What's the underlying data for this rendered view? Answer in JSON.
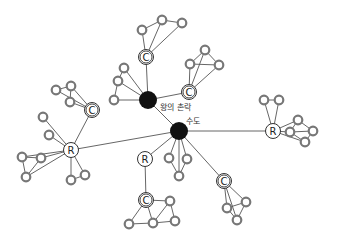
{
  "diagram": {
    "title": "",
    "colors": {
      "edge": "#555555",
      "small_node_stroke": "#777777",
      "hub_fill": "#111111",
      "ring_stroke": "#333333",
      "background": "#ffffff"
    },
    "hubs": [
      {
        "id": "royal-village",
        "label": "왕의 촌락",
        "x": 148,
        "y": 100,
        "r": 9,
        "label_x": 160,
        "label_y": 110
      },
      {
        "id": "capital",
        "label": "수도",
        "x": 179,
        "y": 131,
        "r": 9,
        "label_x": 186,
        "label_y": 124
      }
    ],
    "lettered_nodes": [
      {
        "id": "c-top",
        "letter": "C",
        "x": 146,
        "y": 57
      },
      {
        "id": "c-royal-right",
        "letter": "C",
        "x": 189,
        "y": 92
      },
      {
        "id": "c-left",
        "letter": "C",
        "x": 92,
        "y": 110
      },
      {
        "id": "r-left",
        "letter": "R",
        "x": 71,
        "y": 150
      },
      {
        "id": "r-right",
        "letter": "R",
        "x": 273,
        "y": 131
      },
      {
        "id": "r-bottom",
        "letter": "R",
        "x": 145,
        "y": 159
      },
      {
        "id": "c-bottom",
        "letter": "C",
        "x": 146,
        "y": 200
      },
      {
        "id": "c-bottom-right",
        "letter": "C",
        "x": 224,
        "y": 181
      }
    ],
    "small_nodes": [
      {
        "id": "t1",
        "x": 142,
        "y": 30
      },
      {
        "id": "t2",
        "x": 162,
        "y": 20
      },
      {
        "id": "t3",
        "x": 182,
        "y": 23
      },
      {
        "id": "u1",
        "x": 205,
        "y": 50
      },
      {
        "id": "u2",
        "x": 190,
        "y": 64
      },
      {
        "id": "u3",
        "x": 219,
        "y": 65
      },
      {
        "id": "k1",
        "x": 124,
        "y": 68
      },
      {
        "id": "k2",
        "x": 118,
        "y": 81
      },
      {
        "id": "k3",
        "x": 114,
        "y": 100
      },
      {
        "id": "l1",
        "x": 56,
        "y": 90
      },
      {
        "id": "l2",
        "x": 71,
        "y": 86
      },
      {
        "id": "l3",
        "x": 70,
        "y": 102
      },
      {
        "id": "m1",
        "x": 43,
        "y": 117
      },
      {
        "id": "m2",
        "x": 49,
        "y": 135
      },
      {
        "id": "m3",
        "x": 22,
        "y": 157
      },
      {
        "id": "m4",
        "x": 41,
        "y": 158
      },
      {
        "id": "m5",
        "x": 26,
        "y": 177
      },
      {
        "id": "m6",
        "x": 71,
        "y": 180
      },
      {
        "id": "m7",
        "x": 85,
        "y": 175
      },
      {
        "id": "n1",
        "x": 264,
        "y": 100
      },
      {
        "id": "n2",
        "x": 279,
        "y": 100
      },
      {
        "id": "n3",
        "x": 298,
        "y": 120
      },
      {
        "id": "n4",
        "x": 290,
        "y": 132
      },
      {
        "id": "n5",
        "x": 313,
        "y": 131
      },
      {
        "id": "n6",
        "x": 305,
        "y": 142
      },
      {
        "id": "p1",
        "x": 169,
        "y": 158
      },
      {
        "id": "p2",
        "x": 187,
        "y": 159
      },
      {
        "id": "p3",
        "x": 179,
        "y": 176
      },
      {
        "id": "q1",
        "x": 170,
        "y": 201
      },
      {
        "id": "q2",
        "x": 129,
        "y": 224
      },
      {
        "id": "q3",
        "x": 153,
        "y": 223
      },
      {
        "id": "q4",
        "x": 175,
        "y": 221
      },
      {
        "id": "s1",
        "x": 246,
        "y": 202
      },
      {
        "id": "s2",
        "x": 227,
        "y": 208
      },
      {
        "id": "s3",
        "x": 237,
        "y": 220
      }
    ],
    "edges": [
      [
        "royal-village",
        "capital"
      ],
      [
        "royal-village",
        "c-top"
      ],
      [
        "royal-village",
        "c-royal-right"
      ],
      [
        "royal-village",
        "k1"
      ],
      [
        "royal-village",
        "k2"
      ],
      [
        "royal-village",
        "k3"
      ],
      [
        "k1",
        "k2"
      ],
      [
        "k2",
        "k3"
      ],
      [
        "c-top",
        "t1"
      ],
      [
        "c-top",
        "t2"
      ],
      [
        "c-top",
        "t3"
      ],
      [
        "t1",
        "t2"
      ],
      [
        "t2",
        "t3"
      ],
      [
        "c-royal-right",
        "u1"
      ],
      [
        "c-royal-right",
        "u2"
      ],
      [
        "c-royal-right",
        "u3"
      ],
      [
        "u1",
        "u2"
      ],
      [
        "u2",
        "u3"
      ],
      [
        "u1",
        "u3"
      ],
      [
        "capital",
        "r-left"
      ],
      [
        "capital",
        "r-right"
      ],
      [
        "capital",
        "r-bottom"
      ],
      [
        "capital",
        "p1"
      ],
      [
        "capital",
        "p2"
      ],
      [
        "capital",
        "p3"
      ],
      [
        "capital",
        "c-bottom-right"
      ],
      [
        "p1",
        "p3"
      ],
      [
        "p2",
        "p3"
      ],
      [
        "r-left",
        "c-left"
      ],
      [
        "c-left",
        "l1"
      ],
      [
        "c-left",
        "l2"
      ],
      [
        "c-left",
        "l3"
      ],
      [
        "l1",
        "l2"
      ],
      [
        "l2",
        "l3"
      ],
      [
        "r-left",
        "m1"
      ],
      [
        "r-left",
        "m2"
      ],
      [
        "r-left",
        "m3"
      ],
      [
        "r-left",
        "m4"
      ],
      [
        "r-left",
        "m5"
      ],
      [
        "r-left",
        "m6"
      ],
      [
        "r-left",
        "m7"
      ],
      [
        "m3",
        "m4"
      ],
      [
        "m3",
        "m5"
      ],
      [
        "m4",
        "m5"
      ],
      [
        "m6",
        "m7"
      ],
      [
        "r-right",
        "n1"
      ],
      [
        "r-right",
        "n2"
      ],
      [
        "r-right",
        "n3"
      ],
      [
        "r-right",
        "n4"
      ],
      [
        "r-right",
        "n6"
      ],
      [
        "n1",
        "n2"
      ],
      [
        "n3",
        "n5"
      ],
      [
        "n4",
        "n5"
      ],
      [
        "n5",
        "n6"
      ],
      [
        "n3",
        "n4"
      ],
      [
        "n4",
        "n6"
      ],
      [
        "r-bottom",
        "c-bottom"
      ],
      [
        "c-bottom",
        "q1"
      ],
      [
        "c-bottom",
        "q2"
      ],
      [
        "c-bottom",
        "q3"
      ],
      [
        "q1",
        "q3"
      ],
      [
        "q1",
        "q4"
      ],
      [
        "q2",
        "q3"
      ],
      [
        "q3",
        "q4"
      ],
      [
        "c-bottom-right",
        "s1"
      ],
      [
        "c-bottom-right",
        "s2"
      ],
      [
        "c-bottom-right",
        "s3"
      ],
      [
        "s1",
        "s2"
      ],
      [
        "s1",
        "s3"
      ],
      [
        "s2",
        "s3"
      ]
    ]
  }
}
